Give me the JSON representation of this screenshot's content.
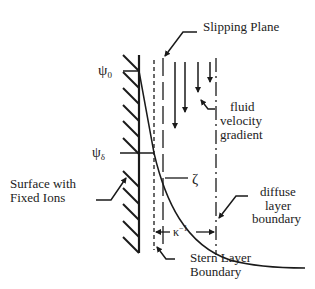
{
  "figure": {
    "colors": {
      "ink": "#1a1a1a",
      "background": "#ffffff"
    }
  },
  "labels": {
    "psi_0": "ψ",
    "psi_0_sub": "0",
    "psi_delta": "ψ",
    "psi_delta_sub": "δ",
    "slipping_plane": "Slipping Plane",
    "fluid_line1": "fluid",
    "fluid_line2": "velocity",
    "fluid_line3": "gradient",
    "zeta": "ζ",
    "diffuse_line1": "diffuse",
    "diffuse_line2": "layer",
    "diffuse_line3": "boundary",
    "surface_line1": "Surface with",
    "surface_line2": "Fixed Ions",
    "kappa": "κ",
    "kappa_sup": "−1",
    "stern_line1": "Stern Layer",
    "stern_line2": "Boundary"
  }
}
